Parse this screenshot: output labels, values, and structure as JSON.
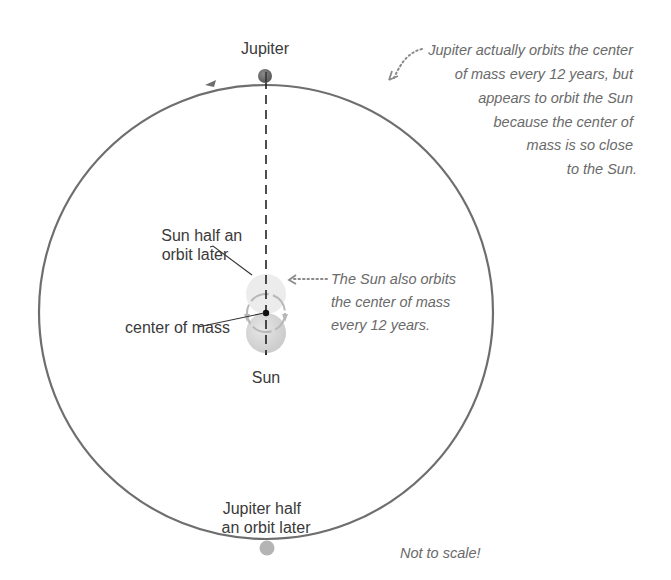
{
  "labels": {
    "jupiter": "Jupiter",
    "sun_half_orbit": [
      "Sun half an",
      "orbit later"
    ],
    "center_of_mass": "center of mass",
    "sun": "Sun",
    "jupiter_half_orbit": [
      "Jupiter half",
      "an orbit later"
    ]
  },
  "notes": {
    "jupiter_orbit": [
      "Jupiter actually orbits the center",
      "of mass every 12 years, but",
      "appears to orbit the Sun",
      "because the center of",
      "mass is so close",
      "to the Sun."
    ],
    "sun_orbit": [
      "The Sun also orbits",
      "the center of mass",
      "every 12 years."
    ],
    "scale": "Not to scale!"
  },
  "colors": {
    "orbit": "#6e6e6e",
    "jupiter": "#6a6a6a",
    "jupiter_later": "#b4b4b4",
    "sun": "#d4d4d4",
    "sun_later": "#ececec",
    "center_of_mass": "#111111",
    "dotted_arrow": "#8a8a8a"
  }
}
